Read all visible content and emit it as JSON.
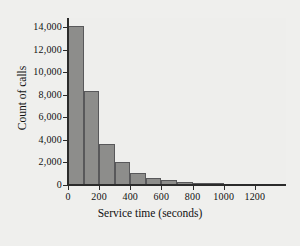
{
  "chart_data": {
    "type": "bar",
    "title": "",
    "xlabel": "Service time (seconds)",
    "ylabel": "Count of calls",
    "xlim": [
      0,
      1400
    ],
    "ylim": [
      0,
      14800
    ],
    "grid": false,
    "legend": "none",
    "bin_width": 100,
    "xticks": [
      "0",
      "200",
      "400",
      "600",
      "800",
      "1000",
      "1200"
    ],
    "xtick_values": [
      0,
      200,
      400,
      600,
      800,
      1000,
      1200
    ],
    "yticks": [
      "0",
      "2,000",
      "4,000",
      "6,000",
      "8,000",
      "10,000",
      "12,000",
      "14,000"
    ],
    "ytick_values": [
      0,
      2000,
      4000,
      6000,
      8000,
      10000,
      12000,
      14000
    ],
    "bin_starts": [
      0,
      100,
      200,
      300,
      400,
      500,
      600,
      700,
      800,
      900,
      1000,
      1100,
      1200
    ],
    "categories": [
      "0-100",
      "100-200",
      "200-300",
      "300-400",
      "400-500",
      "500-600",
      "600-700",
      "700-800",
      "800-900",
      "900-1000",
      "1000-1100",
      "1100-1200",
      "1200-1300"
    ],
    "values": [
      14100,
      8300,
      3600,
      2000,
      1100,
      650,
      450,
      280,
      190,
      150,
      110,
      80,
      60
    ],
    "colors": {
      "bar_fill": "#8d8d8b",
      "bar_stroke": "#58585a",
      "axis": "#2b2b2b",
      "background": "#efefed",
      "plot_background": "#eeeeec",
      "text": "#111111"
    }
  }
}
